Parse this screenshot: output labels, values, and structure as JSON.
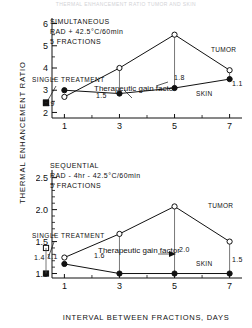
{
  "figure": {
    "faint_header": "THERMAL ENHANCEMENT RATIO TUMOR AND SKIN",
    "ylabel": "THERMAL ENHANCEMENT RATIO",
    "xlabel": "INTERVAL BETWEEN FRACTIONS, DAYS"
  },
  "chart_data": [
    {
      "type": "line",
      "title": "SIMULTANEOUS",
      "subtitle": "RAD + 42.5°C/60min",
      "subtitle2": "5 FRACTIONS",
      "xlabel": "INTERVAL BETWEEN FRACTIONS, DAYS",
      "ylabel": "THERMAL ENHANCEMENT RATIO",
      "x": [
        1,
        3,
        5,
        7
      ],
      "xlim": [
        0.55,
        7.45
      ],
      "ylim": [
        1.75,
        6.25
      ],
      "xticks": [
        1,
        3,
        5,
        7
      ],
      "xticklabels": [
        "1",
        "3",
        "5",
        "7"
      ],
      "yticks": [
        2,
        3,
        4,
        5,
        6
      ],
      "yticklabels": [
        "2",
        "3",
        "4",
        "5",
        "6"
      ],
      "yminorticks": [
        2.5,
        3.5,
        4.5,
        5.5
      ],
      "grid": false,
      "legend": "none",
      "series": [
        {
          "name": "TUMOR",
          "marker": "open-circle",
          "values": [
            2.7,
            4.0,
            5.5,
            3.9
          ]
        },
        {
          "name": "SKIN",
          "marker": "filled-circle",
          "values": [
            3.0,
            2.85,
            3.1,
            3.5
          ]
        }
      ],
      "single_treatment": {
        "label": "SINGLE TREATMENT",
        "tumor_open_square": 2.45,
        "skin_filled_square": 2.42,
        "gain_label": "0.9"
      },
      "gain_labels": [
        {
          "text": "1.5",
          "x": 3
        },
        {
          "text": "1.8",
          "x": 5
        },
        {
          "text": "1.1",
          "x": 7
        }
      ],
      "annotation": "Therapeutic gain factor"
    },
    {
      "type": "line",
      "title": "SEQUENTIAL",
      "subtitle": "RAD - 4hr - 42.5°C/60min",
      "subtitle2": "5 FRACTIONS",
      "xlabel": "INTERVAL BETWEEN FRACTIONS, DAYS",
      "ylabel": "THERMAL ENHANCEMENT RATIO",
      "x": [
        1,
        3,
        5,
        7
      ],
      "xlim": [
        0.55,
        7.45
      ],
      "ylim": [
        0.93,
        2.62
      ],
      "xticks": [
        1,
        3,
        5,
        7
      ],
      "xticklabels": [
        "1",
        "3",
        "5",
        "7"
      ],
      "yticks": [
        1.0,
        1.5,
        2.0,
        2.5
      ],
      "yticklabels": [
        "1.0",
        "1.5",
        "2.0",
        "2.5"
      ],
      "yminorticks": [
        1.1,
        1.2,
        1.3,
        1.4,
        1.6,
        1.7,
        1.8,
        1.9,
        2.1,
        2.2,
        2.3,
        2.4
      ],
      "grid": false,
      "legend": "none",
      "series": [
        {
          "name": "TUMOR",
          "marker": "open-circle",
          "values": [
            1.25,
            1.62,
            2.05,
            1.5
          ]
        },
        {
          "name": "SKIN",
          "marker": "filled-circle",
          "values": [
            1.15,
            1.0,
            1.0,
            1.0
          ]
        }
      ],
      "single_treatment": {
        "label": "SINGLE TREATMENT",
        "tumor_open_square": 1.4,
        "skin_filled_square": 1.0,
        "gain_label": "1.4",
        "gain_label2": "1.1"
      },
      "gain_labels": [
        {
          "text": "1.6",
          "x": 3
        },
        {
          "text": "2.0",
          "x": 5
        },
        {
          "text": "1.5",
          "x": 7
        }
      ],
      "annotation": "Therapeutic gain factor"
    }
  ]
}
